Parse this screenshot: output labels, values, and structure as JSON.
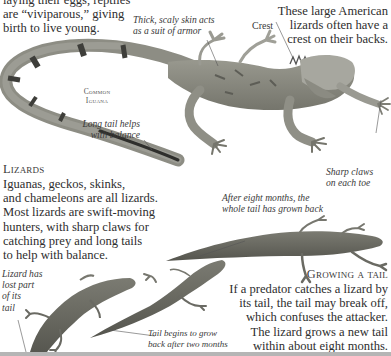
{
  "intro": {
    "lines": [
      "laying their eggs, reptiles",
      "are “viviparous,” giving",
      "birth to live young."
    ]
  },
  "iguana": {
    "intro_right": [
      "These large American",
      "lizards often have a",
      "crest on their backs."
    ],
    "name_label": [
      "Common",
      "Iguana"
    ],
    "callouts": {
      "skin": [
        "Thick, scaly skin acts",
        "as a suit of armor"
      ],
      "crest": "Crest",
      "tail": [
        "Long tail helps",
        "with balance"
      ],
      "claws": [
        "Sharp claws",
        "on each toe"
      ]
    }
  },
  "lizards_section": {
    "heading": "Lizards",
    "lines": [
      "Iguanas, geckos, skinks,",
      "and chameleons are all lizards.",
      "Most lizards are swift-moving",
      "hunters, with sharp claws for",
      "catching prey and long tails",
      "to help with balance."
    ]
  },
  "tail_regrowth": {
    "callouts": {
      "eight_months": [
        "After eight months, the",
        "whole tail has grown back"
      ],
      "lost_tail": [
        "Lizard has",
        "lost part",
        "of its",
        "tail"
      ],
      "two_months": [
        "Tail begins to grow",
        "back after two months"
      ]
    },
    "heading": "Growing a tail",
    "lines": [
      "If a predator catches a lizard by",
      "its tail, the tail may break off,",
      "which confuses the attacker.",
      "The lizard grows a new tail",
      "within about eight months."
    ]
  },
  "colors": {
    "background": "#ffffff",
    "text": "#2e2e2e",
    "iguana_body": "#8f8f86",
    "lizard_body": "#6f6f66",
    "bottom_rule": "#b5b5b5"
  }
}
